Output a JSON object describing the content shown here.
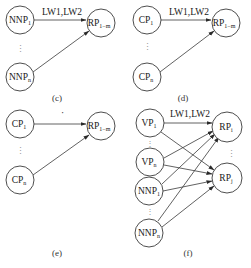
{
  "panels": [
    {
      "id": "c",
      "caption": "(c)",
      "edge_label": "LW1,LW2",
      "sources": [
        {
          "base": "NNP",
          "sub": "1"
        },
        {
          "base": "NNP",
          "sub": "n"
        }
      ],
      "target": {
        "base": "RP",
        "sub": "1−m"
      }
    },
    {
      "id": "d",
      "caption": "(d)",
      "edge_label": "LW1,LW2",
      "sources": [
        {
          "base": "CP",
          "sub": "1"
        },
        {
          "base": "CP",
          "sub": "n"
        }
      ],
      "target": {
        "base": "RP",
        "sub": "1−m"
      }
    },
    {
      "id": "e",
      "caption": "(e)",
      "edge_label": "·",
      "sources": [
        {
          "base": "CP",
          "sub": "1"
        },
        {
          "base": "CP",
          "sub": "n"
        }
      ],
      "target": {
        "base": "RP",
        "sub": "1−m"
      }
    },
    {
      "id": "f",
      "caption": "(f)",
      "edge_label": "LW1,LW2",
      "sources": [
        {
          "base": "VP",
          "sub": "1"
        },
        {
          "base": "VP",
          "sub": "n"
        },
        {
          "base": "NNP",
          "sub": "1"
        },
        {
          "base": "NNP",
          "sub": "n"
        }
      ],
      "targets": [
        {
          "base": "RP",
          "sub": "i"
        },
        {
          "base": "RP",
          "sub": "j"
        }
      ]
    }
  ],
  "ellipsis": "⋮",
  "colors": {
    "stroke": "#3a3a3a",
    "background": "#ffffff"
  }
}
